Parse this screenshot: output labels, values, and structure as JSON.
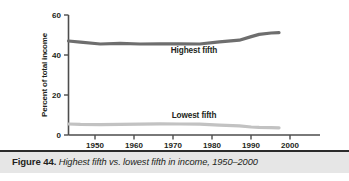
{
  "caption": {
    "figure_label": "Figure 44.",
    "title": "Highest fifth vs. lowest fifth in income, 1950–2000"
  },
  "colors": {
    "highest_fifth_line": "#6e6e6e",
    "lowest_fifth_line": "#c2c2c2",
    "axis": "#4d4d4d",
    "caption_band": "#e6e6e6",
    "caption_rule": "#2b2b2b",
    "text": "#231f20"
  },
  "axis": {
    "y_title": "Percent of total income",
    "y_ticks": [
      "0",
      "20",
      "40",
      "60"
    ],
    "x_ticks": [
      "1950",
      "1960",
      "1970",
      "1980",
      "1990",
      "2000"
    ]
  },
  "series_labels": {
    "highest": "Highest fifth",
    "lowest": "Lowest fifth"
  },
  "chart_data": {
    "type": "line",
    "title": "Highest fifth vs. lowest fifth in income, 1950–2000",
    "xlabel": "",
    "ylabel": "Percent of total income",
    "xlim": [
      1947,
      2001
    ],
    "ylim": [
      0,
      60
    ],
    "ytick_values": [
      0,
      20,
      40,
      60
    ],
    "xtick_values": [
      1950,
      1960,
      1970,
      1980,
      1990,
      2000
    ],
    "grid": false,
    "legend": "inline-labels",
    "series": [
      {
        "name": "Highest fifth",
        "color": "#6e6e6e",
        "x": [
          1947,
          1950,
          1955,
          1960,
          1965,
          1970,
          1975,
          1980,
          1985,
          1990,
          1993,
          1995,
          1998,
          2000
        ],
        "values": [
          47.0,
          46.4,
          45.5,
          45.8,
          45.5,
          45.6,
          45.6,
          45.5,
          46.6,
          47.4,
          49.2,
          50.3,
          51.0,
          51.2
        ]
      },
      {
        "name": "Lowest fifth",
        "color": "#c2c2c2",
        "x": [
          1947,
          1950,
          1955,
          1960,
          1965,
          1970,
          1975,
          1980,
          1985,
          1990,
          1993,
          1995,
          1998,
          2000
        ],
        "values": [
          5.5,
          5.3,
          5.2,
          5.3,
          5.4,
          5.6,
          5.5,
          5.4,
          4.9,
          4.6,
          4.0,
          3.8,
          3.7,
          3.6
        ]
      }
    ]
  }
}
